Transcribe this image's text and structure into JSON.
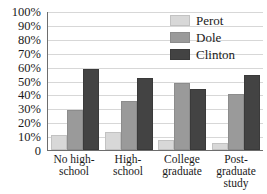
{
  "chart_data": {
    "type": "bar",
    "title": "",
    "xlabel": "",
    "ylabel": "",
    "ylim": [
      0,
      100
    ],
    "ytick_labels": [
      "100%",
      "90%",
      "80%",
      "70%",
      "60%",
      "50%",
      "40%",
      "30%",
      "20%",
      "10%",
      "0"
    ],
    "ytick_values": [
      100,
      90,
      80,
      70,
      60,
      50,
      40,
      30,
      20,
      10,
      0
    ],
    "grid": true,
    "legend_position": "top-right",
    "categories": [
      "No high-school",
      "High-school",
      "College graduate",
      "Post-graduate study"
    ],
    "series": [
      {
        "name": "Perot",
        "color": "#d8d8d8",
        "values": [
          11,
          13,
          7,
          5
        ]
      },
      {
        "name": "Dole",
        "color": "#9a9a9a",
        "values": [
          29,
          35,
          48,
          40
        ]
      },
      {
        "name": "Clinton",
        "color": "#434343",
        "values": [
          58,
          52,
          44,
          54
        ]
      }
    ]
  },
  "legend": {
    "items": [
      {
        "label": "Perot"
      },
      {
        "label": "Dole"
      },
      {
        "label": "Clinton"
      }
    ]
  },
  "x_axis": {
    "labels": [
      "No high-\nschool",
      "High-\nschool",
      "College\ngraduate",
      "Post-\ngraduate\nstudy"
    ]
  }
}
